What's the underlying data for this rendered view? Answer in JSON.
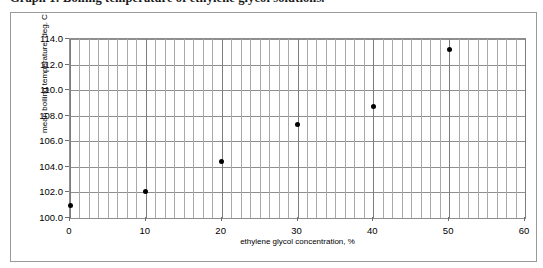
{
  "caption": {
    "text": "Graph 1: Boiling temperature of ethylene glycol solutions."
  },
  "chart_data": {
    "type": "scatter",
    "title": "",
    "xlabel": "ethylene glycol concentration, %",
    "ylabel": "mean boiling temperature, deg. C",
    "xlim": [
      0,
      60
    ],
    "ylim": [
      100.0,
      114.0
    ],
    "xticks": [
      "0",
      "10",
      "20",
      "30",
      "40",
      "50",
      "60"
    ],
    "xtick_values": [
      0,
      10,
      20,
      30,
      40,
      50,
      60
    ],
    "yticks": [
      "100.0",
      "102.0",
      "104.0",
      "106.0",
      "108.0",
      "110.0",
      "112.0",
      "114.0"
    ],
    "ytick_values": [
      100.0,
      102.0,
      104.0,
      106.0,
      108.0,
      110.0,
      112.0,
      114.0
    ],
    "grid": true,
    "grid_minor_x": true,
    "minor_x_step": 1.25,
    "legend": false,
    "marker": "filled-diamond",
    "marker_color": "#000000",
    "x": [
      0,
      10,
      20,
      30,
      40,
      50
    ],
    "values": [
      101.0,
      102.1,
      104.4,
      107.3,
      108.7,
      113.2
    ],
    "points": [
      {
        "x": 0,
        "y": 101.0
      },
      {
        "x": 10,
        "y": 102.1
      },
      {
        "x": 20,
        "y": 104.4
      },
      {
        "x": 30,
        "y": 107.3
      },
      {
        "x": 40,
        "y": 108.7
      },
      {
        "x": 50,
        "y": 113.2
      }
    ]
  }
}
